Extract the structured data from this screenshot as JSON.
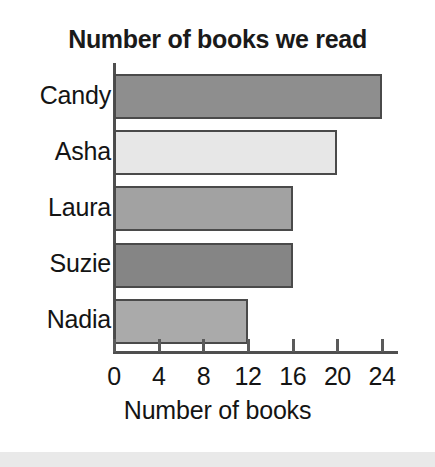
{
  "chart_data": {
    "type": "bar",
    "orientation": "horizontal",
    "title": "Number of books we read",
    "xlabel": "Number of books",
    "ylabel": "",
    "categories": [
      "Candy",
      "Asha",
      "Laura",
      "Suzie",
      "Nadia"
    ],
    "values": [
      24,
      20,
      16,
      16,
      12
    ],
    "xlim": [
      0,
      24
    ],
    "xticks": [
      0,
      4,
      8,
      12,
      16,
      20,
      24
    ],
    "xtick_labels": [
      "0",
      "4",
      "8",
      "12",
      "16",
      "20",
      "24"
    ],
    "grid": false,
    "legend": false,
    "bar_colors": [
      "#8e8e8e",
      "#e7e7e7",
      "#a2a2a2",
      "#858585",
      "#aaaaaa"
    ],
    "bar_edge_color": "#4a4a4a",
    "axis_color": "#4f4f4f",
    "text_color": "#141414",
    "background": "#ffffff"
  }
}
